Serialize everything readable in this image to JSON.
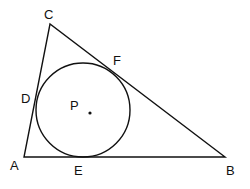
{
  "figure": {
    "vertices": {
      "A": {
        "label": "A",
        "x": 24,
        "y": 157
      },
      "B": {
        "label": "B",
        "x": 225,
        "y": 157
      },
      "C": {
        "label": "C",
        "x": 50,
        "y": 24
      }
    },
    "tangent_points": {
      "D": {
        "label": "D",
        "x": 36,
        "y": 105
      },
      "E": {
        "label": "E",
        "x": 83,
        "y": 157
      },
      "F": {
        "label": "F",
        "x": 110,
        "y": 70
      }
    },
    "incircle": {
      "center_label": "P",
      "cx": 83,
      "cy": 110,
      "r": 47
    },
    "stroke_color": "#111111",
    "background": "#ffffff"
  }
}
